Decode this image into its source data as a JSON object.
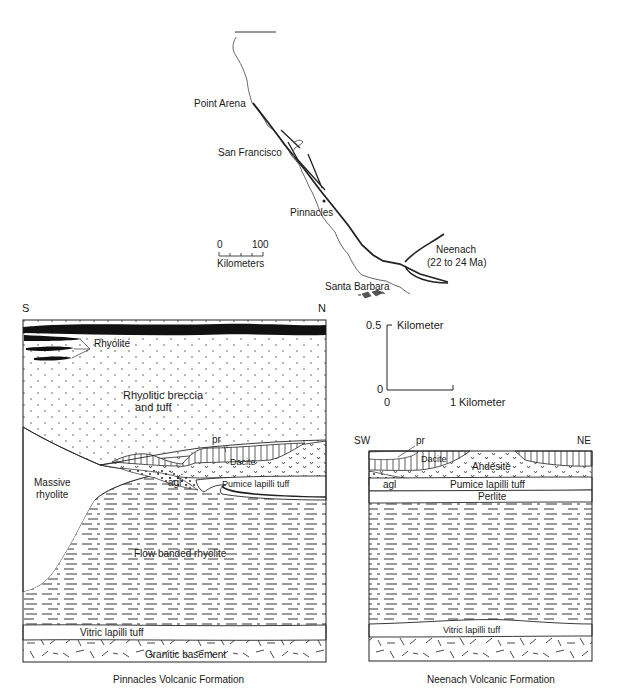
{
  "map": {
    "places": [
      {
        "name": "Point Arena"
      },
      {
        "name": "San Francisco"
      },
      {
        "name": "Pinnacles"
      },
      {
        "name": "Neenach",
        "age": "(22 to 24 Ma)"
      },
      {
        "name": "Santa Barbara"
      }
    ],
    "scale": {
      "min": "0",
      "max": "100",
      "unit": "Kilometers"
    }
  },
  "section_scale": {
    "vertical_max": "0.5",
    "vertical_unit": "Kilometer",
    "origin_v": "0",
    "origin_h": "0",
    "horizontal_max": "1",
    "horizontal_unit": "Kilometer"
  },
  "pinnacles": {
    "title": "Pinnacles Volcanic Formation",
    "left_dir": "S",
    "right_dir": "N",
    "units": {
      "rhyolite": "Rhyolite",
      "breccia_1": "Rhyolitic breccia",
      "breccia_2": "and tuff",
      "pr": "pr",
      "dacite": "Dacite",
      "massive_1": "Massive",
      "massive_2": "rhyolite",
      "agl": "agl",
      "pumice": "Pumice lapilli tuff",
      "flow": "Flow banded rhyolite",
      "vitric": "Vitric lapilli tuff",
      "granitic": "Granitic basement"
    }
  },
  "neenach": {
    "title": "Neenach Volcanic Formation",
    "left_dir": "SW",
    "right_dir": "NE",
    "units": {
      "pr": "pr",
      "dacite": "Dacite",
      "andesite": "Andesite",
      "agl": "agl",
      "pumice": "Pumice lapilli tuff",
      "perlite": "Perlite",
      "vitric": "Vitric lapilli tuff"
    }
  }
}
